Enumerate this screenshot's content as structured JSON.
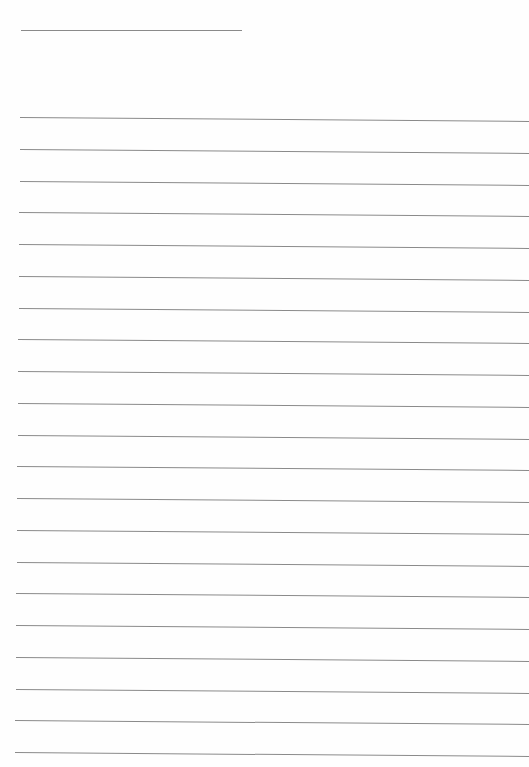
{
  "page": {
    "type": "lined-paper",
    "background": "#fefefe",
    "line_color": "#8a8a8a",
    "header_line": {
      "x": 21,
      "y": 30,
      "width": 221
    },
    "ruled_lines": {
      "count": 21,
      "first_y": 117,
      "spacing": 31.75,
      "left_x": 20,
      "right_x": 529,
      "tilt_px": 4
    }
  }
}
